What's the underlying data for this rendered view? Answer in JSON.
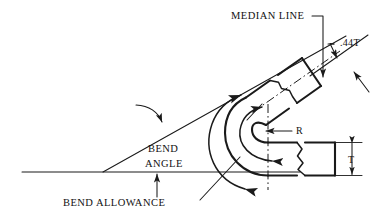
{
  "diagram": {
    "background_color": "#ffffff",
    "line_color": "#1a1a1a",
    "labels": {
      "median_line": "MEDIAN LINE",
      "setback_factor": ".44T",
      "radius": "R",
      "thickness": "T",
      "bend_angle_line1": "BEND",
      "bend_angle_line2": "ANGLE",
      "bend_allowance": "BEND ALLOWANCE"
    },
    "annotations": [
      {
        "name": "median-line",
        "text": "MEDIAN LINE",
        "leader": "horizontal then vertical down with arrowhead onto the dash-dot median centerline of the upper flange"
      },
      {
        "name": "setback-factor",
        "text": ".44T",
        "leader": "short elbow leader down-left with arrowhead onto upper dimension line"
      },
      {
        "name": "inside-radius",
        "text": "R",
        "leader": "horizontal leader left with arrowhead to the inside bend radius from the bend centerpoint"
      },
      {
        "name": "material-thickness",
        "text": "T",
        "leader": "vertical double-ended dimension arrows spanning the lower flange thickness"
      },
      {
        "name": "bend-angle",
        "text": "BEND ANGLE",
        "leader": "curved arrow pointing to the inclined flange axis line; angle arc between baseline and inclined line"
      },
      {
        "name": "bend-allowance",
        "text": "BEND ALLOWANCE",
        "leader": "dash leader up-right to the arc with double arrowheads along the median line through the bend"
      }
    ],
    "geometry_notes": {
      "part": "U-shaped bent sheet metal, lower flange horizontal, upper flange inclined upward to the right",
      "break_lines": "zigzag break lines terminate both flanges",
      "centerlines": "dash-dot median line through upper flange; vertical dash-dot bend centerline"
    }
  }
}
